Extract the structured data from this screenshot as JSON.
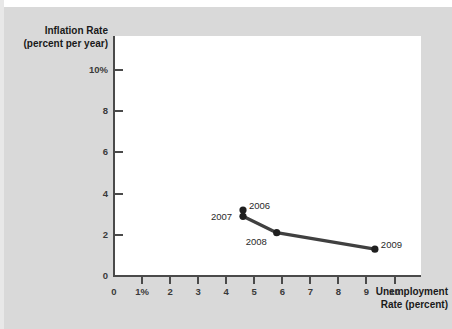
{
  "figure": {
    "background_color": "#d9d9d9",
    "plot_background_color": "#ffffff",
    "axis_color": "#4a4a4a",
    "series_color": "#404040"
  },
  "chart_data": {
    "type": "line",
    "title": "",
    "xlabel": "Unemployment Rate (percent)",
    "ylabel": "Inflation Rate (percent per year)",
    "xlim": [
      0,
      11
    ],
    "ylim": [
      0,
      11.5
    ],
    "grid": false,
    "legend": "none",
    "x_ticks": [
      {
        "value": 0,
        "label": "0"
      },
      {
        "value": 1,
        "label": "1%"
      },
      {
        "value": 2,
        "label": "2"
      },
      {
        "value": 3,
        "label": "3"
      },
      {
        "value": 4,
        "label": "4"
      },
      {
        "value": 5,
        "label": "5"
      },
      {
        "value": 6,
        "label": "6"
      },
      {
        "value": 7,
        "label": "7"
      },
      {
        "value": 8,
        "label": "8"
      },
      {
        "value": 9,
        "label": "9"
      },
      {
        "value": 10,
        "label": "10"
      }
    ],
    "y_ticks": [
      {
        "value": 0,
        "label": "0"
      },
      {
        "value": 2,
        "label": "2"
      },
      {
        "value": 4,
        "label": "4"
      },
      {
        "value": 6,
        "label": "6"
      },
      {
        "value": 8,
        "label": "8"
      },
      {
        "value": 10,
        "label": "10%"
      }
    ],
    "series": [
      {
        "name": "Phillips curve points",
        "marker": "circle",
        "points": [
          {
            "label": "2006",
            "x": 4.6,
            "y": 3.2,
            "label_pos": "right"
          },
          {
            "label": "2007",
            "x": 4.6,
            "y": 2.9,
            "label_pos": "left"
          },
          {
            "label": "2008",
            "x": 5.8,
            "y": 2.1,
            "label_pos": "below-left"
          },
          {
            "label": "2009",
            "x": 9.3,
            "y": 1.3,
            "label_pos": "right"
          }
        ]
      }
    ]
  }
}
